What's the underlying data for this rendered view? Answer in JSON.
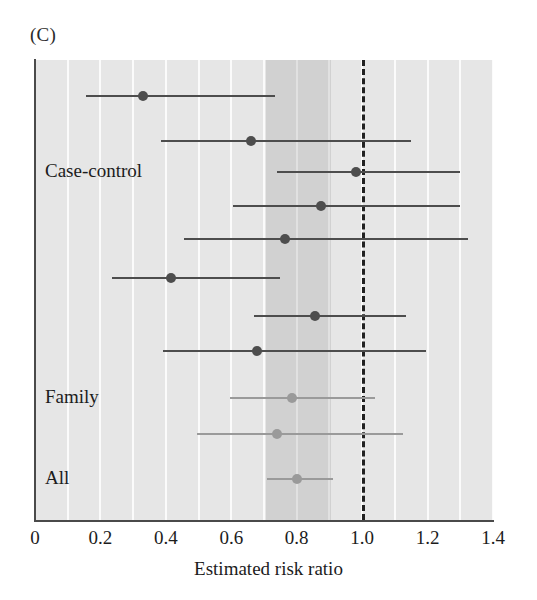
{
  "panel": {
    "label": "(C)"
  },
  "chart_data": {
    "type": "scatter",
    "subtype": "forest-plot",
    "title": "",
    "panel_label": "(C)",
    "xlabel": "Estimated risk ratio",
    "ylabel": "",
    "xlim": [
      0,
      1.4
    ],
    "xticks": [
      "0",
      "0.2",
      "0.4",
      "0.6",
      "0.8",
      "1.0",
      "1.2",
      "1.4"
    ],
    "xtick_values": [
      0,
      0.2,
      0.4,
      0.6,
      0.8,
      1.0,
      1.2,
      1.4
    ],
    "gridlines": "vertical white lines every 0.1",
    "null_line": 1.0,
    "shaded_band": [
      0.705,
      0.905
    ],
    "group_labels": [
      {
        "label": "Case-control",
        "y_row": 3
      },
      {
        "label": "Family",
        "y_row": 9
      },
      {
        "label": "All",
        "y_row": 11
      }
    ],
    "legend": "none",
    "series": [
      {
        "name": "Individual studies",
        "point_color": "#4d4d4d",
        "line_color": "#4d4d4d",
        "points": [
          {
            "estimate": 0.33,
            "ci_low": 0.155,
            "ci_high": 0.735
          },
          {
            "estimate": 0.66,
            "ci_low": 0.385,
            "ci_high": 1.15
          },
          {
            "estimate": 0.98,
            "ci_low": 0.74,
            "ci_high": 1.3
          },
          {
            "estimate": 0.875,
            "ci_low": 0.605,
            "ci_high": 1.3
          },
          {
            "estimate": 0.765,
            "ci_low": 0.455,
            "ci_high": 1.325
          },
          {
            "estimate": 0.415,
            "ci_low": 0.235,
            "ci_high": 0.75
          },
          {
            "estimate": 0.855,
            "ci_low": 0.67,
            "ci_high": 1.135
          },
          {
            "estimate": 0.68,
            "ci_low": 0.39,
            "ci_high": 1.195
          }
        ]
      },
      {
        "name": "Summary estimates",
        "point_color": "#9a9a9a",
        "line_color": "#9a9a9a",
        "points": [
          {
            "estimate": 0.785,
            "ci_low": 0.595,
            "ci_high": 1.04
          },
          {
            "estimate": 0.74,
            "ci_low": 0.495,
            "ci_high": 1.125
          },
          {
            "estimate": 0.8,
            "ci_low": 0.71,
            "ci_high": 0.91
          }
        ]
      }
    ],
    "rows": [
      {
        "index": 1,
        "estimate": 0.33,
        "ci_low": 0.155,
        "ci_high": 0.735,
        "group": "Case-control",
        "style": "dark"
      },
      {
        "index": 2,
        "estimate": 0.66,
        "ci_low": 0.385,
        "ci_high": 1.15,
        "group": "Case-control",
        "style": "dark"
      },
      {
        "index": 3,
        "estimate": 0.98,
        "ci_low": 0.74,
        "ci_high": 1.3,
        "group": "Case-control",
        "style": "dark"
      },
      {
        "index": 4,
        "estimate": 0.875,
        "ci_low": 0.605,
        "ci_high": 1.3,
        "group": "Case-control",
        "style": "dark"
      },
      {
        "index": 5,
        "estimate": 0.765,
        "ci_low": 0.455,
        "ci_high": 1.325,
        "group": "Case-control",
        "style": "dark"
      },
      {
        "index": 6,
        "estimate": 0.415,
        "ci_low": 0.235,
        "ci_high": 0.75,
        "group": "Case-control",
        "style": "dark"
      },
      {
        "index": 7,
        "estimate": 0.855,
        "ci_low": 0.67,
        "ci_high": 1.135,
        "group": "Case-control",
        "style": "dark"
      },
      {
        "index": 8,
        "estimate": 0.68,
        "ci_low": 0.39,
        "ci_high": 1.195,
        "group": "Case-control",
        "style": "dark"
      },
      {
        "index": 9,
        "estimate": 0.785,
        "ci_low": 0.595,
        "ci_high": 1.04,
        "group": "Family",
        "style": "light"
      },
      {
        "index": 10,
        "estimate": 0.74,
        "ci_low": 0.495,
        "ci_high": 1.125,
        "group": "Family",
        "style": "light"
      },
      {
        "index": 11,
        "estimate": 0.8,
        "ci_low": 0.71,
        "ci_high": 0.91,
        "group": "All",
        "style": "light"
      }
    ]
  },
  "colors": {
    "plot_background": "#e6e6e6",
    "gridline": "#fbfbfb",
    "band": "rgba(150,150,150,0.26)",
    "marker_dark": "#4d4d4d",
    "marker_light": "#9a9a9a",
    "axis": "#4a4a4a",
    "text": "#1c1c1c"
  }
}
